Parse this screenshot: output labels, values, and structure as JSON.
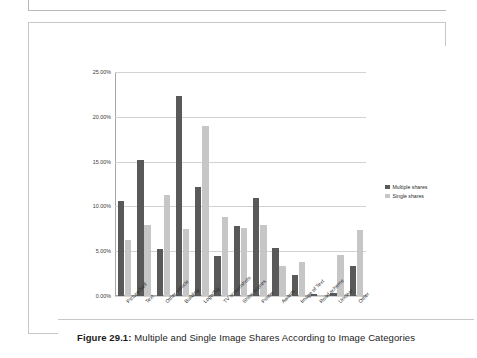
{
  "figure": {
    "caption_number": "Figure 29.1:",
    "caption_text": " Multiple and Single Image Shares According to Image Categories"
  },
  "legend": {
    "position": "right",
    "entries": [
      {
        "label": "Multiple shares",
        "color": "#595959"
      },
      {
        "label": "Single shares",
        "color": "#c6c6c6"
      }
    ]
  },
  "chart_data": {
    "type": "bar",
    "title": "",
    "xlabel": "",
    "ylabel": "",
    "ylim": [
      0,
      25
    ],
    "grid": true,
    "ytick_labels": [
      "0.00%",
      "5.00%",
      "10.00%",
      "15.00%",
      "20.00%",
      "25.00%"
    ],
    "ytick_values": [
      0,
      5,
      10,
      15,
      20,
      25
    ],
    "categories": [
      "Picture/Self",
      "Text",
      "Other vehicle",
      "Building",
      "Logo/Sig",
      "TV screenshots",
      "Show scenes",
      "Poster",
      "Awards",
      "Image of Text",
      "Road scheme",
      "Unclear",
      "Other"
    ],
    "series": [
      {
        "name": "Multiple shares",
        "color": "#595959",
        "values": [
          10.6,
          15.2,
          5.3,
          22.3,
          12.2,
          4.5,
          7.8,
          10.9,
          5.4,
          2.3,
          0.2,
          0.3,
          3.3
        ]
      },
      {
        "name": "Single shares",
        "color": "#c6c6c6",
        "values": [
          6.2,
          7.9,
          11.3,
          7.5,
          19.0,
          8.8,
          7.6,
          7.9,
          3.4,
          3.8,
          0.1,
          4.6,
          7.4
        ]
      }
    ]
  }
}
